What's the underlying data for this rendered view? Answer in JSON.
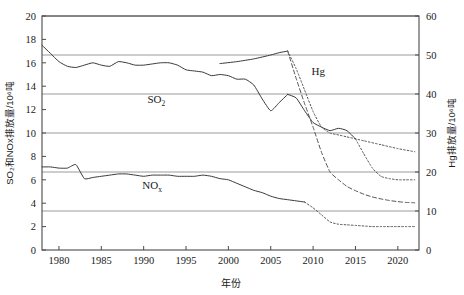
{
  "chart_data": {
    "type": "line",
    "title": "",
    "xlabel": "年份",
    "ylabel": "SO₂和NOx排放量/10⁶吨",
    "ylabel_right": "Hg排放量/10⁶吨",
    "xlim": [
      1978,
      2022.5
    ],
    "ylim": [
      0,
      20
    ],
    "ylim_right": [
      0,
      60
    ],
    "grid": true,
    "legend_position": "inline-annotations",
    "x_ticks": [
      "1980",
      "1985",
      "1990",
      "1995",
      "2000",
      "2005",
      "2010",
      "2015",
      "2020"
    ],
    "x_tick_values": [
      1980,
      1985,
      1990,
      1995,
      2000,
      2005,
      2010,
      2015,
      2020
    ],
    "y_ticks_left": [
      "0",
      "2",
      "4",
      "6",
      "8",
      "10",
      "12",
      "14",
      "16",
      "18",
      "20"
    ],
    "y_tick_values_left": [
      0,
      2,
      4,
      6,
      8,
      10,
      12,
      14,
      16,
      18,
      20
    ],
    "y_ticks_right": [
      "0",
      "10",
      "20",
      "30",
      "40",
      "50",
      "60"
    ],
    "y_tick_values_right": [
      0,
      10,
      20,
      30,
      40,
      50,
      60
    ],
    "annotations": [
      {
        "name": "so2-label",
        "text": "SO",
        "sub": "2",
        "x": 1991.5,
        "y": 12.6,
        "axis": "left"
      },
      {
        "name": "nox-label",
        "text": "NO",
        "sub": "x",
        "x": 1991.0,
        "y": 5.25,
        "axis": "left"
      },
      {
        "name": "hg-label",
        "text": "Hg",
        "sub": "",
        "x": 2010.6,
        "y": 15.0,
        "axis": "left"
      }
    ],
    "series": [
      {
        "name": "SO2",
        "axis": "left",
        "style": "solid",
        "color": "#3a3a3a",
        "x": [
          1978,
          1979,
          1980,
          1981,
          1982,
          1983,
          1984,
          1985,
          1986,
          1987,
          1988,
          1989,
          1990,
          1991,
          1992,
          1993,
          1994,
          1995,
          1996,
          1997,
          1998,
          1999,
          2000,
          2001,
          2002,
          2003,
          2004,
          2005,
          2006,
          2007
        ],
        "values": [
          17.5,
          16.8,
          16.1,
          15.7,
          15.6,
          15.8,
          16.0,
          15.8,
          15.7,
          16.1,
          16.0,
          15.8,
          15.8,
          15.9,
          16.0,
          16.0,
          15.8,
          15.4,
          15.3,
          15.2,
          14.9,
          15.0,
          14.9,
          14.6,
          14.6,
          14.1,
          12.9,
          11.9,
          12.6,
          13.3
        ]
      },
      {
        "name": "SO2-continued",
        "axis": "left",
        "style": "solid",
        "color": "#3a3a3a",
        "x": [
          2007,
          2008,
          2009,
          2010,
          2011,
          2012,
          2013,
          2014,
          2015
        ],
        "values": [
          13.3,
          13.0,
          11.9,
          10.9,
          10.5,
          10.2,
          10.4,
          10.2,
          9.5
        ]
      },
      {
        "name": "SO2-projection",
        "axis": "left",
        "style": "dotted",
        "color": "#555555",
        "x": [
          2015,
          2016,
          2017,
          2018,
          2019,
          2020,
          2021,
          2022
        ],
        "values": [
          9.5,
          8.2,
          7.0,
          6.3,
          6.1,
          6.0,
          6.0,
          6.0
        ]
      },
      {
        "name": "NOx",
        "axis": "left",
        "style": "solid",
        "color": "#3a3a3a",
        "x": [
          1978,
          1979,
          1980,
          1981,
          1982,
          1983,
          1984,
          1985,
          1986,
          1987,
          1988,
          1989,
          1990,
          1991,
          1992,
          1993,
          1994,
          1995,
          1996,
          1997,
          1998,
          1999,
          2000,
          2001,
          2002,
          2003,
          2004,
          2005,
          2006,
          2007,
          2008,
          2009
        ],
        "values": [
          7.1,
          7.1,
          7.0,
          7.0,
          7.3,
          6.1,
          6.2,
          6.3,
          6.4,
          6.5,
          6.5,
          6.4,
          6.3,
          6.4,
          6.4,
          6.4,
          6.3,
          6.3,
          6.3,
          6.4,
          6.3,
          6.1,
          6.0,
          5.7,
          5.4,
          5.1,
          4.9,
          4.6,
          4.4,
          4.3,
          4.2,
          4.1
        ]
      },
      {
        "name": "NOx-projection",
        "axis": "left",
        "style": "dotted",
        "color": "#555555",
        "x": [
          2009,
          2010,
          2011,
          2012,
          2013,
          2014,
          2015,
          2016,
          2017,
          2018,
          2019,
          2020,
          2021,
          2022
        ],
        "values": [
          4.1,
          3.6,
          3.0,
          2.4,
          2.2,
          2.15,
          2.1,
          2.05,
          2.0,
          2.0,
          2.0,
          2.0,
          2.0,
          2.0
        ]
      },
      {
        "name": "Hg",
        "axis": "right",
        "style": "solid",
        "color": "#3a3a3a",
        "x": [
          1999,
          2001,
          2003,
          2005,
          2006,
          2007
        ],
        "values": [
          47.8,
          48.3,
          49.0,
          50.0,
          50.6,
          51.0
        ]
      },
      {
        "name": "Hg-projection",
        "axis": "right",
        "style": "dashed",
        "color": "#555555",
        "x": [
          2007,
          2008,
          2009,
          2010,
          2011,
          2012,
          2013,
          2014,
          2015,
          2016,
          2017,
          2018,
          2019,
          2020,
          2021,
          2022
        ],
        "values": [
          51.0,
          44.0,
          37.5,
          31.5,
          25.0,
          20.0,
          18.0,
          16.3,
          15.2,
          14.3,
          13.6,
          13.1,
          12.7,
          12.4,
          12.2,
          12.1
        ]
      },
      {
        "name": "Hg-upper-projection",
        "axis": "right",
        "style": "dotted",
        "color": "#555555",
        "x": [
          2007,
          2008,
          2009,
          2010,
          2011,
          2012,
          2013,
          2014,
          2016,
          2018,
          2020,
          2022
        ],
        "values": [
          51.0,
          46.5,
          41.0,
          35.5,
          31.5,
          30.0,
          29.5,
          29.0,
          28.0,
          27.0,
          26.0,
          25.2
        ]
      }
    ]
  }
}
